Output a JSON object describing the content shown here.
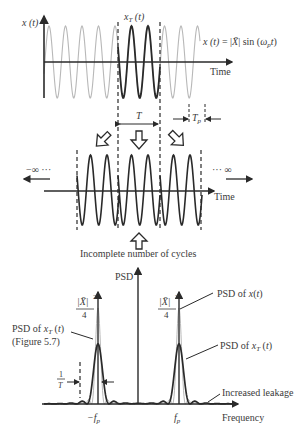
{
  "figure": {
    "top_panel": {
      "y_label": "x (t)",
      "truncated_label": "x_T (t)",
      "equation": "x (t) = |X̄| sin (ω_p t)",
      "x_label": "Time",
      "period_window_label": "T",
      "period_label": "T_p"
    },
    "middle_panel": {
      "left_infinity": "−∞ ···",
      "right_infinity": "··· ∞",
      "x_label": "Time",
      "caption": "Incomplete number of cycles"
    },
    "bottom_panel": {
      "y_label": "PSD",
      "peak_label_num": "|X̄|",
      "peak_label_exp": "2",
      "peak_label_den": "4",
      "psd_x_label": "PSD of x(t)",
      "psd_xT_label": "PSD of x_T (t)",
      "psd_xT_left_label_line1": "PSD of x_T (t)",
      "psd_xT_left_label_line2": "(Figure 5.7)",
      "bandwidth_label_num": "1",
      "bandwidth_label_den": "T",
      "leakage_label": "Increased leakage",
      "neg_freq_label": "−f_p",
      "pos_freq_label": "f_p",
      "x_label": "Frequency"
    },
    "colors": {
      "axis": "#2a2a2a",
      "signal_light": "#b8b8b8",
      "signal_bold": "#2a2a2a",
      "text": "#3a3a3a"
    }
  }
}
